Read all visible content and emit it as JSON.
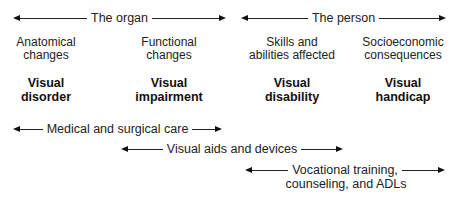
{
  "top_arrows": [
    {
      "label": "The organ"
    },
    {
      "label": "The person"
    }
  ],
  "columns": [
    {
      "description_line1": "Anatomical",
      "description_line2": "changes",
      "term_line1": "Visual",
      "term_line2": "disorder"
    },
    {
      "description_line1": "Functional",
      "description_line2": "changes",
      "term_line1": "Visual",
      "term_line2": "impairment"
    },
    {
      "description_line1": "Skills and",
      "description_line2": "abilities affected",
      "term_line1": "Visual",
      "term_line2": "disability"
    },
    {
      "description_line1": "Socioeconomic",
      "description_line2": "consequences",
      "term_line1": "Visual",
      "term_line2": "handicap"
    }
  ],
  "bottom_arrows": [
    {
      "label": "Medical and surgical care"
    },
    {
      "label": "Visual aids and devices"
    },
    {
      "label_line1": "Vocational training,",
      "label_line2": "counseling, and ADLs"
    }
  ]
}
